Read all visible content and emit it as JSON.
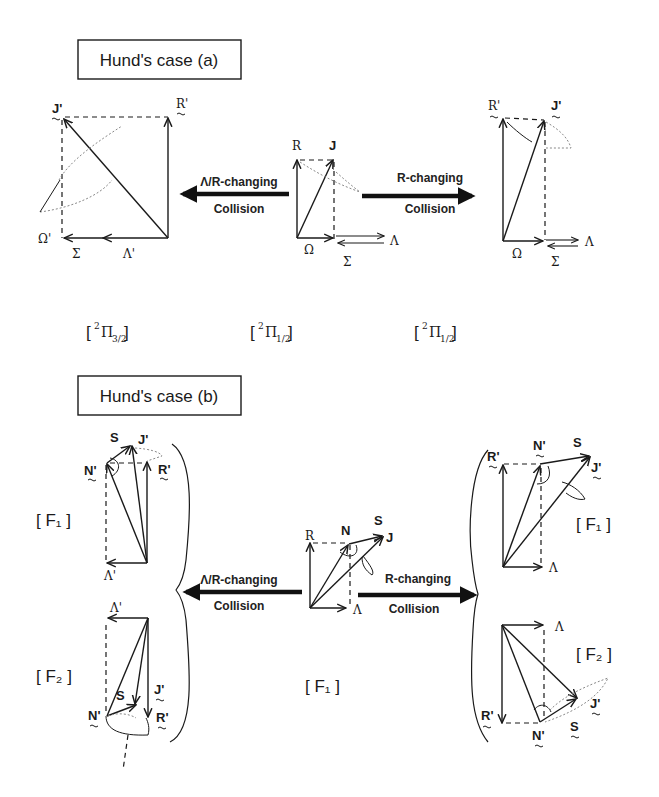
{
  "case_a": {
    "title": "Hund's case (a)",
    "left": {
      "labels": {
        "J": "J'",
        "R": "R'",
        "Omega": "Ω'",
        "Sigma": "Σ",
        "Lambda": "Λ'"
      },
      "state": {
        "prefix": "2",
        "symbol": "Π",
        "subscript": "3/2"
      }
    },
    "center": {
      "labels": {
        "J": "J",
        "R": "R",
        "Omega": "Ω",
        "Sigma": "Σ",
        "Lambda": "Λ"
      },
      "state": {
        "prefix": "2",
        "symbol": "Π",
        "subscript": "1/2"
      }
    },
    "right": {
      "labels": {
        "J": "J'",
        "R": "R'",
        "Omega": "Ω",
        "Sigma": "Σ",
        "Lambda": "Λ"
      },
      "state": {
        "prefix": "2",
        "symbol": "Π",
        "subscript": "1/2"
      }
    },
    "left_arrow": {
      "line1": "Λ/R-changing",
      "line2": "Collision"
    },
    "right_arrow": {
      "line1": "R-changing",
      "line2": "Collision"
    }
  },
  "case_b": {
    "title": "Hund's case (b)",
    "left_top": {
      "labels": {
        "S": "S",
        "J": "J'",
        "N": "N'",
        "R": "R'",
        "Lambda": "Λ'"
      },
      "state": "[ F₁ ]"
    },
    "left_bottom": {
      "labels": {
        "Lambda": "Λ'",
        "S": "S",
        "J": "J'",
        "N": "N'",
        "R": "R'"
      },
      "state": "[ F₂ ]"
    },
    "center": {
      "labels": {
        "R": "R",
        "N": "N",
        "S": "S",
        "J": "J",
        "Lambda": "Λ"
      },
      "state": "[ F₁ ]"
    },
    "right_top": {
      "labels": {
        "R": "R'",
        "N": "N'",
        "S": "S",
        "J": "J'",
        "Lambda": "Λ"
      },
      "state": "[ F₁ ]"
    },
    "right_bottom": {
      "labels": {
        "Lambda": "Λ",
        "R": "R'",
        "N": "N'",
        "S": "S",
        "J": "J'"
      },
      "state": "[ F₂ ]"
    },
    "left_arrow": {
      "line1": "Λ/R-changing",
      "line2": "Collision"
    },
    "right_arrow": {
      "line1": "R-changing",
      "line2": "Collision"
    }
  }
}
